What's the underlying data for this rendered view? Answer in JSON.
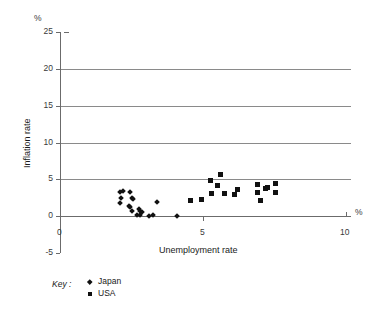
{
  "chart_data": {
    "type": "scatter",
    "title": "",
    "xlabel": "Unemployment rate",
    "ylabel": "Inflation rate",
    "x_unit": "%",
    "y_unit": "%",
    "xlim": [
      0,
      10
    ],
    "ylim": [
      -5,
      25
    ],
    "x_ticks": [
      "0",
      "5",
      "10"
    ],
    "x_tick_values": [
      0,
      5,
      10
    ],
    "y_ticks": [
      "-5",
      "0",
      "5",
      "10",
      "15",
      "20",
      "25"
    ],
    "y_tick_values": [
      -5,
      0,
      5,
      10,
      15,
      20,
      25
    ],
    "grid": "horizontal gridlines at y = 0, 5, 10, 15, 20",
    "legend_position": "below-axis-left",
    "legend_title": "Key :",
    "series": [
      {
        "name": "Japan",
        "marker": "diamond",
        "color": "#111111",
        "points": [
          [
            2.1,
            3.2
          ],
          [
            2.2,
            3.4
          ],
          [
            2.15,
            2.4
          ],
          [
            2.1,
            1.8
          ],
          [
            2.45,
            3.3
          ],
          [
            2.5,
            2.5
          ],
          [
            2.55,
            2.3
          ],
          [
            2.4,
            1.4
          ],
          [
            2.45,
            1.2
          ],
          [
            2.5,
            0.7
          ],
          [
            2.75,
            1.0
          ],
          [
            2.8,
            0.7
          ],
          [
            2.85,
            0.6
          ],
          [
            2.7,
            0.2
          ],
          [
            2.8,
            0.1
          ],
          [
            3.1,
            0.05
          ],
          [
            3.25,
            0.15
          ],
          [
            3.4,
            1.9
          ],
          [
            4.1,
            0.05
          ]
        ]
      },
      {
        "name": "USA",
        "marker": "square",
        "color": "#111111",
        "points": [
          [
            4.55,
            2.1
          ],
          [
            4.95,
            2.3
          ],
          [
            5.25,
            4.8
          ],
          [
            5.3,
            3.1
          ],
          [
            5.5,
            4.2
          ],
          [
            5.6,
            5.6
          ],
          [
            5.75,
            3.0
          ],
          [
            6.1,
            2.9
          ],
          [
            6.2,
            3.6
          ],
          [
            6.9,
            4.3
          ],
          [
            6.9,
            3.2
          ],
          [
            7.0,
            2.1
          ],
          [
            7.2,
            3.7
          ],
          [
            7.25,
            3.9
          ],
          [
            7.55,
            4.4
          ],
          [
            7.55,
            3.2
          ]
        ]
      }
    ]
  }
}
